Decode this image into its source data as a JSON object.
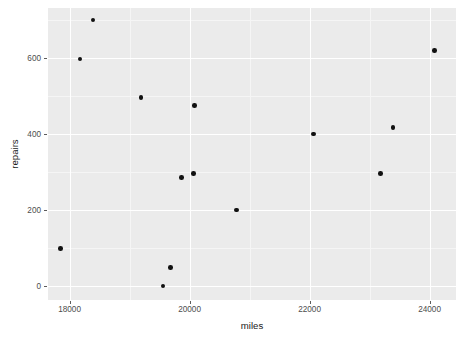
{
  "chart_data": {
    "type": "scatter",
    "title": "",
    "xlabel": "miles",
    "ylabel": "repairs",
    "xlim": [
      17640,
      24440
    ],
    "ylim": [
      -37,
      731
    ],
    "x_ticks": [
      18000,
      20000,
      22000,
      24000
    ],
    "x_tick_labels": [
      "18000",
      "20000",
      "22000",
      "24000"
    ],
    "y_ticks": [
      0,
      200,
      400,
      600
    ],
    "y_tick_labels": [
      "0",
      "200",
      "400",
      "600"
    ],
    "x_minor_ticks": [
      19000,
      21000,
      23000
    ],
    "y_minor_ticks": [
      100,
      300,
      500,
      700
    ],
    "grid": true,
    "legend": "none",
    "point_color": "#111111",
    "panel_background": "#ebebeb",
    "grid_color": "#ffffff",
    "points": [
      {
        "x": 17850,
        "y": 99
      },
      {
        "x": 18170,
        "y": 597
      },
      {
        "x": 18390,
        "y": 699
      },
      {
        "x": 19190,
        "y": 496
      },
      {
        "x": 19560,
        "y": 0
      },
      {
        "x": 19680,
        "y": 48
      },
      {
        "x": 19864,
        "y": 285
      },
      {
        "x": 20068,
        "y": 296
      },
      {
        "x": 20085,
        "y": 475
      },
      {
        "x": 20780,
        "y": 200
      },
      {
        "x": 22068,
        "y": 400
      },
      {
        "x": 23186,
        "y": 296
      },
      {
        "x": 23390,
        "y": 416
      },
      {
        "x": 24085,
        "y": 619
      }
    ]
  }
}
